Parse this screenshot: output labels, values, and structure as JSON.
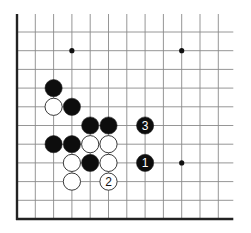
{
  "diagram": {
    "type": "go-board-fragment",
    "background": "#ffffff",
    "line_color": "#8a8a8a",
    "edge_color": "#222222",
    "grid": {
      "cols": 12,
      "rows": 11,
      "origin_x": 17,
      "origin_y": 32,
      "spacing_x": 18.3,
      "spacing_y": 18.7,
      "line_extend_top": 18,
      "line_extend_right": 15,
      "edges": [
        "left",
        "bottom"
      ]
    },
    "star_points": [
      {
        "col": 3,
        "row": 1
      },
      {
        "col": 9,
        "row": 1
      },
      {
        "col": 9,
        "row": 7
      }
    ],
    "stones": [
      {
        "color": "black",
        "col": 2,
        "row": 3,
        "label": ""
      },
      {
        "color": "white",
        "col": 2,
        "row": 4,
        "label": ""
      },
      {
        "color": "black",
        "col": 3,
        "row": 4,
        "label": ""
      },
      {
        "color": "black",
        "col": 4,
        "row": 5,
        "label": ""
      },
      {
        "color": "black",
        "col": 5,
        "row": 5,
        "label": ""
      },
      {
        "color": "black",
        "col": 7,
        "row": 5,
        "label": "3"
      },
      {
        "color": "black",
        "col": 2,
        "row": 6,
        "label": ""
      },
      {
        "color": "black",
        "col": 3,
        "row": 6,
        "label": ""
      },
      {
        "color": "white",
        "col": 4,
        "row": 6,
        "label": ""
      },
      {
        "color": "white",
        "col": 5,
        "row": 6,
        "label": ""
      },
      {
        "color": "white",
        "col": 3,
        "row": 7,
        "label": ""
      },
      {
        "color": "black",
        "col": 4,
        "row": 7,
        "label": ""
      },
      {
        "color": "white",
        "col": 5,
        "row": 7,
        "label": ""
      },
      {
        "color": "black",
        "col": 7,
        "row": 7,
        "label": "1"
      },
      {
        "color": "white",
        "col": 3,
        "row": 8,
        "label": ""
      },
      {
        "color": "white",
        "col": 5,
        "row": 8,
        "label": "2"
      }
    ]
  }
}
